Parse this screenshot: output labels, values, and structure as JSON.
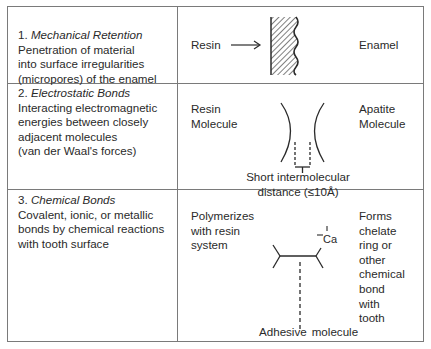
{
  "rows": [
    {
      "number": "1.",
      "title": "Mechanical Retention",
      "description": [
        "Penetration of material",
        "into surface irregularities",
        "(micropores) of the enamel"
      ],
      "diagram": {
        "left_label": "Resin",
        "arrow": "→",
        "right_label": "Enamel"
      }
    },
    {
      "number": "2.",
      "title": "Electrostatic Bonds",
      "description": [
        "Interacting electromagnetic",
        "energies between closely",
        "adjacent molecules",
        "(van der Waal's forces)"
      ],
      "diagram": {
        "left_label": [
          "Resin",
          "Molecule"
        ],
        "right_label": [
          "Apatite",
          "Molecule"
        ],
        "caption": [
          "Short intermolecular",
          "distance (≤10Å)"
        ]
      }
    },
    {
      "number": "3.",
      "title": "Chemical Bonds",
      "description": [
        "Covalent, ionic, or metallic",
        "bonds by chemical reactions",
        "with tooth surface"
      ],
      "diagram": {
        "left_label": [
          "Polymerizes",
          "with resin",
          "system"
        ],
        "atom_label": "Ca",
        "right_label": [
          "Forms",
          "chelate",
          "ring or",
          "other",
          "chemical",
          "bond",
          "with",
          "tooth"
        ],
        "caption_left": "Adhesive",
        "caption_right": "molecule"
      }
    }
  ]
}
